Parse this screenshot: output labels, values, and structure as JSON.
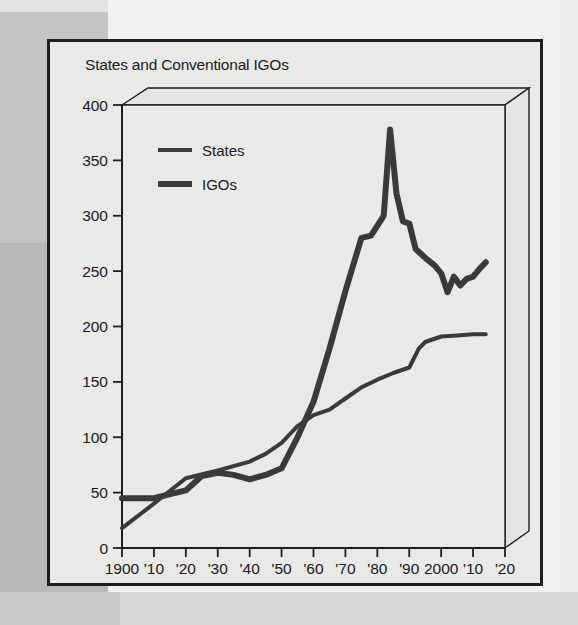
{
  "figure": {
    "title": "States and Conventional IGOs",
    "frame_color": "#1d1d1d",
    "plot_background": "#e9e9e7"
  },
  "legend": {
    "position": "top-left-inside",
    "entries": [
      {
        "label": "States",
        "swatch_name": "states-swatch",
        "color": "#3a3a3a",
        "thickness": 4
      },
      {
        "label": "IGOs",
        "swatch_name": "igos-swatch",
        "color": "#3a3a3a",
        "thickness": 6
      }
    ]
  },
  "axes": {
    "y_ticks": [
      "0",
      "50",
      "100",
      "150",
      "200",
      "250",
      "300",
      "350",
      "400"
    ],
    "x_ticks": [
      "1900",
      "'10",
      "'20",
      "'30",
      "'40",
      "'50",
      "'60",
      "'70",
      "'80",
      "'90",
      "2000",
      "'10",
      "'20"
    ]
  },
  "chart_data": {
    "type": "line",
    "title": "States and Conventional IGOs",
    "xlabel": "",
    "ylabel": "",
    "xlim": [
      1900,
      2020
    ],
    "ylim": [
      0,
      400
    ],
    "ytick_values": [
      0,
      50,
      100,
      150,
      200,
      250,
      300,
      350,
      400
    ],
    "xtick_values": [
      1900,
      1910,
      1920,
      1930,
      1940,
      1950,
      1960,
      1970,
      1980,
      1990,
      2000,
      2010,
      2020
    ],
    "xtick_labels": [
      "1900",
      "'10",
      "'20",
      "'30",
      "'40",
      "'50",
      "'60",
      "'70",
      "'80",
      "'90",
      "2000",
      "'10",
      "'20"
    ],
    "grid": false,
    "legend": [
      "States",
      "IGOs"
    ],
    "series": [
      {
        "name": "States",
        "color": "#3a3a3a",
        "linewidth": 4,
        "x": [
          1900,
          1910,
          1920,
          1930,
          1940,
          1945,
          1950,
          1955,
          1960,
          1965,
          1970,
          1975,
          1980,
          1985,
          1990,
          1993,
          1995,
          2000,
          2005,
          2010,
          2014
        ],
        "y": [
          18,
          40,
          63,
          70,
          78,
          85,
          95,
          110,
          120,
          125,
          135,
          145,
          152,
          158,
          163,
          180,
          186,
          191,
          192,
          193,
          193
        ]
      },
      {
        "name": "IGOs",
        "color": "#3a3a3a",
        "linewidth": 6,
        "x": [
          1900,
          1910,
          1920,
          1925,
          1930,
          1935,
          1940,
          1945,
          1950,
          1955,
          1960,
          1965,
          1970,
          1975,
          1978,
          1982,
          1984,
          1986,
          1988,
          1990,
          1992,
          1995,
          1998,
          2000,
          2002,
          2004,
          2006,
          2008,
          2010,
          2012,
          2014
        ],
        "y": [
          45,
          45,
          52,
          65,
          68,
          66,
          62,
          66,
          72,
          100,
          132,
          180,
          232,
          280,
          282,
          300,
          378,
          320,
          295,
          293,
          270,
          262,
          255,
          248,
          231,
          245,
          237,
          243,
          245,
          252,
          258
        ]
      }
    ],
    "annotations": [
      {
        "text": "IGO peak",
        "x": 1984,
        "y": 378
      },
      {
        "text": "series cross",
        "x": 1957,
        "y": 115
      }
    ]
  }
}
